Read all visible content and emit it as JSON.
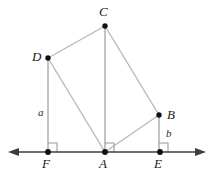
{
  "figure": {
    "canvas": {
      "width": 213,
      "height": 172
    },
    "colors": {
      "background": "#ffffff",
      "baseline": "#3c3c3c",
      "segment": "#b9b9b9",
      "vertical": "#bdbdbd",
      "point": "#111111",
      "right_angle": "#9a9a9a",
      "label": "#1a1a1a"
    },
    "baseline": {
      "name": "horizontal-axis",
      "y": 152,
      "x_start": 8,
      "x_end": 206,
      "arrows": "both"
    },
    "points": [
      {
        "id": "C",
        "label": "C",
        "x": 105,
        "y": 26,
        "label_x": 99,
        "label_y": 5,
        "on_baseline": false
      },
      {
        "id": "D",
        "label": "D",
        "x": 48,
        "y": 58,
        "label_x": 32,
        "label_y": 50,
        "on_baseline": false
      },
      {
        "id": "B",
        "label": "B",
        "x": 159,
        "y": 115,
        "label_x": 167,
        "label_y": 108,
        "on_baseline": false
      },
      {
        "id": "F",
        "label": "F",
        "x": 48,
        "y": 152,
        "label_x": 42,
        "label_y": 157,
        "on_baseline": true
      },
      {
        "id": "A",
        "label": "A",
        "x": 105,
        "y": 152,
        "label_x": 99,
        "label_y": 157,
        "on_baseline": true
      },
      {
        "id": "E",
        "label": "E",
        "x": 160,
        "y": 152,
        "label_x": 154,
        "label_y": 157,
        "on_baseline": true
      }
    ],
    "segments": [
      {
        "id": "DC",
        "from": "D",
        "to": "C",
        "style": "slanted"
      },
      {
        "id": "CB",
        "from": "C",
        "to": "B",
        "style": "slanted"
      },
      {
        "id": "DA",
        "from": "D",
        "to": "A",
        "style": "slanted"
      },
      {
        "id": "AB",
        "from": "A",
        "to": "B",
        "style": "slanted"
      },
      {
        "id": "DF",
        "from": "D",
        "to": "F",
        "style": "vertical"
      },
      {
        "id": "CA",
        "from": "C",
        "to": "A",
        "style": "vertical"
      },
      {
        "id": "BE",
        "from": "B",
        "to": "E",
        "style": "vertical"
      }
    ],
    "length_labels": [
      {
        "id": "a",
        "label": "a",
        "segment": "DF",
        "x": 38,
        "y": 107
      },
      {
        "id": "b",
        "label": "b",
        "segment": "BE",
        "x": 166,
        "y": 128
      }
    ],
    "right_angles": [
      {
        "id": "angle-at-F",
        "vertex": "F",
        "size": 9,
        "opens": "up-right"
      },
      {
        "id": "angle-at-A",
        "vertex": "A",
        "size": 9,
        "opens": "up-right"
      },
      {
        "id": "angle-at-E",
        "vertex": "E",
        "size": 9,
        "opens": "up-right"
      }
    ]
  }
}
